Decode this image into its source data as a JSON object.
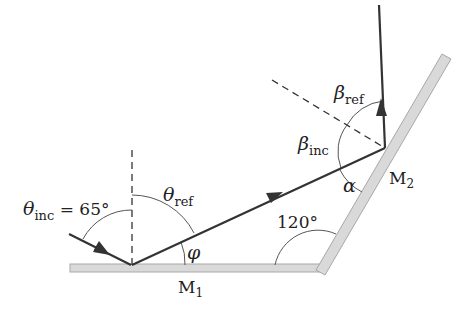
{
  "diagram": {
    "type": "two-mirror reflection",
    "mirrors": [
      {
        "id": "M1",
        "label_main": "M",
        "label_sub": "1"
      },
      {
        "id": "M2",
        "label_main": "M",
        "label_sub": "2"
      }
    ],
    "labels": {
      "theta_inc": {
        "symbol": "θ",
        "sub": "inc",
        "value": " = 65°"
      },
      "theta_ref": {
        "symbol": "θ",
        "sub": "ref"
      },
      "phi": {
        "symbol": "φ"
      },
      "angle_between_mirrors": "120°",
      "alpha": {
        "symbol": "α"
      },
      "beta_inc": {
        "symbol": "β",
        "sub": "inc"
      },
      "beta_ref": {
        "symbol": "β",
        "sub": "ref"
      }
    },
    "colors": {
      "ray": "#333333",
      "mirror_fill": "#d9d9d9",
      "mirror_edge": "#a8a8a8",
      "arc": "#555555",
      "dashed": "#333333"
    }
  }
}
